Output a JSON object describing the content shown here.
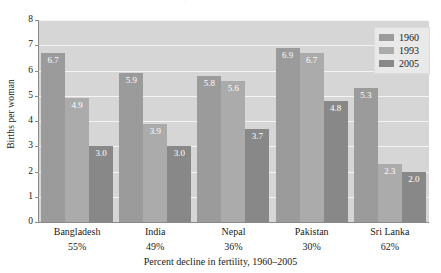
{
  "figure": {
    "cropped_title": "Fertility Decline in South Asia",
    "background_color": "#ffffff",
    "plot_background_color": "#d6d6d6",
    "gridline_color": "#f4f4f4",
    "axis_color": "#8a8a8a"
  },
  "legend": {
    "position": "top-right",
    "entries": [
      {
        "label": "1960",
        "color": "#9b9b9b"
      },
      {
        "label": "1993",
        "color": "#ababab"
      },
      {
        "label": "2005",
        "color": "#888888"
      }
    ]
  },
  "chart_data": {
    "type": "bar",
    "title": "",
    "xlabel": "Percent decline in fertility,  1960–2005",
    "ylabel": "Births per woman",
    "ylim": [
      0,
      8
    ],
    "yticks": [
      0,
      1,
      2,
      3,
      4,
      5,
      6,
      7,
      8
    ],
    "ytick_labels": [
      "0",
      "1",
      "2",
      "3",
      "4",
      "5",
      "6",
      "7",
      "8"
    ],
    "grid": true,
    "legend_position": "upper right",
    "categories": [
      "Bangladesh",
      "India",
      "Nepal",
      "Pakistan",
      "Sri Lanka"
    ],
    "category_sublabels": [
      "55%",
      "49%",
      "36%",
      "30%",
      "62%"
    ],
    "series": [
      {
        "name": "1960",
        "color": "#9b9b9b",
        "values": [
          6.7,
          5.9,
          5.8,
          6.9,
          5.3
        ],
        "labels": [
          "6.7",
          "5.9",
          "5.8",
          "6.9",
          "5.3"
        ]
      },
      {
        "name": "1993",
        "color": "#ababab",
        "values": [
          4.9,
          3.9,
          5.6,
          6.7,
          2.3
        ],
        "labels": [
          "4.9",
          "3.9",
          "5.6",
          "6.7",
          "2.3"
        ]
      },
      {
        "name": "2005",
        "color": "#888888",
        "values": [
          3.0,
          3.0,
          3.7,
          4.8,
          2.0
        ],
        "labels": [
          "3.0",
          "3.0",
          "3.7",
          "4.8",
          "2.0"
        ]
      }
    ]
  }
}
